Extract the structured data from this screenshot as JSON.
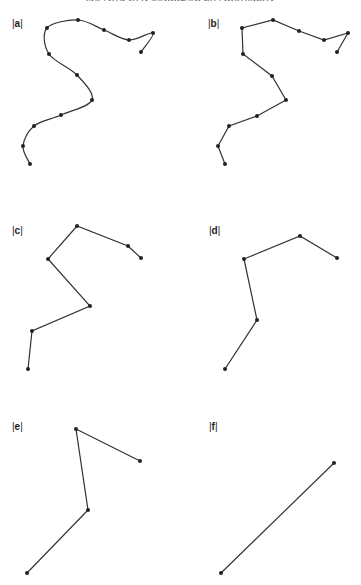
{
  "header": {
    "title": "MOVING IN A CORRIDOR ENVIRONMENT"
  },
  "panels": [
    {
      "id": "a",
      "label": "a",
      "label_pos": [
        12,
        18
      ],
      "style": "smooth",
      "points": [
        [
          30,
          164
        ],
        [
          23,
          146
        ],
        [
          34,
          126
        ],
        [
          61,
          115
        ],
        [
          92,
          100
        ],
        [
          77,
          75
        ],
        [
          49,
          54
        ],
        [
          47,
          28
        ],
        [
          78,
          20
        ],
        [
          104,
          30
        ],
        [
          129,
          40
        ],
        [
          153,
          33
        ],
        [
          141,
          52
        ]
      ]
    },
    {
      "id": "b",
      "label": "b",
      "label_pos": [
        208,
        18
      ],
      "style": "polyline",
      "points": [
        [
          225,
          164
        ],
        [
          218,
          146
        ],
        [
          229,
          126
        ],
        [
          257,
          116
        ],
        [
          286,
          100
        ],
        [
          272,
          76
        ],
        [
          243,
          54
        ],
        [
          242,
          28
        ],
        [
          273,
          20
        ],
        [
          299,
          31
        ],
        [
          324,
          40
        ],
        [
          348,
          33
        ],
        [
          337,
          52
        ]
      ]
    },
    {
      "id": "c",
      "label": "c",
      "label_pos": [
        12,
        225
      ],
      "style": "polyline",
      "points": [
        [
          28,
          369
        ],
        [
          32,
          331
        ],
        [
          90,
          306
        ],
        [
          48,
          259
        ],
        [
          77,
          226
        ],
        [
          128,
          246
        ],
        [
          141,
          258
        ]
      ]
    },
    {
      "id": "d",
      "label": "d",
      "label_pos": [
        209,
        225
      ],
      "style": "polyline",
      "points": [
        [
          225,
          369
        ],
        [
          257,
          320
        ],
        [
          244,
          259
        ],
        [
          300,
          236
        ],
        [
          337,
          258
        ]
      ]
    },
    {
      "id": "e",
      "label": "e",
      "label_pos": [
        12,
        421
      ],
      "style": "polyline",
      "points": [
        [
          27,
          573
        ],
        [
          88,
          510
        ],
        [
          76,
          429
        ],
        [
          140,
          461
        ]
      ]
    },
    {
      "id": "f",
      "label": "f",
      "label_pos": [
        209,
        421
      ],
      "style": "polyline",
      "points": [
        [
          221,
          573
        ],
        [
          334,
          463
        ]
      ]
    }
  ],
  "colors": {
    "line": "#333333",
    "point": "#222222",
    "background": "#ffffff"
  }
}
